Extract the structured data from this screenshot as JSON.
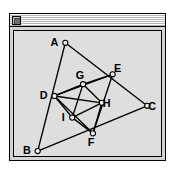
{
  "window": {
    "title": "",
    "close_box_icon": "close-box-icon"
  },
  "diagram": {
    "type": "geometry-construction",
    "viewbox": {
      "width": 149,
      "height": 127
    },
    "points": [
      {
        "id": "A",
        "label": "A",
        "x": 52,
        "y": 12,
        "label_dx": -11,
        "label_dy": 3
      },
      {
        "id": "B",
        "label": "B",
        "x": 24,
        "y": 122,
        "label_dx": -11,
        "label_dy": 3
      },
      {
        "id": "C",
        "label": "C",
        "x": 135,
        "y": 76,
        "label_dx": 5,
        "label_dy": 4
      },
      {
        "id": "D",
        "label": "D",
        "x": 41,
        "y": 66,
        "label_dx": -11,
        "label_dy": 3
      },
      {
        "id": "E",
        "label": "E",
        "x": 100,
        "y": 44,
        "label_dx": 5,
        "label_dy": -2
      },
      {
        "id": "F",
        "label": "F",
        "x": 80,
        "y": 104,
        "label_dx": -2,
        "label_dy": 13
      },
      {
        "id": "G",
        "label": "G",
        "x": 70,
        "y": 54,
        "label_dx": -3,
        "label_dy": -5
      },
      {
        "id": "H",
        "label": "H",
        "x": 89,
        "y": 73,
        "label_dx": 5,
        "label_dy": 4
      },
      {
        "id": "I",
        "label": "I",
        "x": 59,
        "y": 88,
        "label_dx": -9,
        "label_dy": 3
      }
    ],
    "edges": [
      {
        "from": "A",
        "to": "B"
      },
      {
        "from": "B",
        "to": "C"
      },
      {
        "from": "C",
        "to": "A"
      },
      {
        "from": "D",
        "to": "E"
      },
      {
        "from": "E",
        "to": "F"
      },
      {
        "from": "F",
        "to": "D"
      },
      {
        "from": "D",
        "to": "G"
      },
      {
        "from": "G",
        "to": "E"
      },
      {
        "from": "G",
        "to": "H"
      },
      {
        "from": "H",
        "to": "F"
      },
      {
        "from": "D",
        "to": "I"
      },
      {
        "from": "I",
        "to": "F"
      },
      {
        "from": "I",
        "to": "G"
      },
      {
        "from": "I",
        "to": "H"
      },
      {
        "from": "D",
        "to": "H"
      }
    ],
    "colors": {
      "stroke": "#000000",
      "vertex_fill": "#f2f2f2",
      "canvas_background": "#dedede",
      "window_background": "#d3d3d3"
    }
  }
}
